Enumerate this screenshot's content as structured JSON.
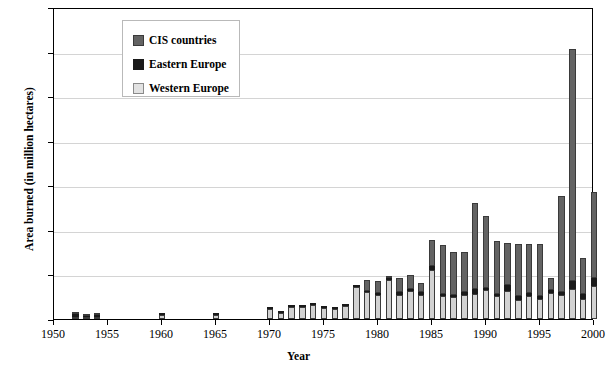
{
  "chart_data": {
    "type": "bar",
    "stacked": true,
    "title": "",
    "xlabel": "Year",
    "ylabel": "Area burned (in million hectares)",
    "xlim": [
      1950,
      2000
    ],
    "ylim": [
      0,
      7
    ],
    "y_ticks": [
      0,
      1,
      2,
      3,
      4,
      5,
      6,
      7
    ],
    "x_ticks": [
      1950,
      1955,
      1960,
      1965,
      1970,
      1975,
      1980,
      1985,
      1990,
      1995,
      2000
    ],
    "grid": "horizontal",
    "legend_position": "top-left",
    "legend": [
      "CIS countries",
      "Eastern Europe",
      "Western Europe"
    ],
    "colors": {
      "cis": "#636363",
      "eastern": "#1a1a1a",
      "western": "#d2d2d2"
    },
    "categories": [
      1950,
      1951,
      1952,
      1953,
      1954,
      1955,
      1956,
      1957,
      1958,
      1959,
      1960,
      1961,
      1962,
      1963,
      1964,
      1965,
      1966,
      1967,
      1968,
      1969,
      1970,
      1971,
      1972,
      1973,
      1974,
      1975,
      1976,
      1977,
      1978,
      1979,
      1980,
      1981,
      1982,
      1983,
      1984,
      1985,
      1986,
      1987,
      1988,
      1989,
      1990,
      1991,
      1992,
      1993,
      1994,
      1995,
      1996,
      1997,
      1998,
      1999,
      2000
    ],
    "series": [
      {
        "name": "Western Europe",
        "values": [
          0,
          0,
          0.05,
          0.04,
          0.05,
          0,
          0,
          0,
          0,
          0,
          0.08,
          0,
          0,
          0,
          0,
          0.09,
          0,
          0,
          0,
          0,
          0.22,
          0.14,
          0.26,
          0.28,
          0.31,
          0.24,
          0.23,
          0.3,
          0.72,
          0.6,
          0.53,
          0.88,
          0.55,
          0.62,
          0.55,
          1.1,
          0.52,
          0.5,
          0.55,
          0.57,
          0.65,
          0.52,
          0.62,
          0.43,
          0.52,
          0.45,
          0.59,
          0.55,
          0.68,
          0.46,
          0.73
        ]
      },
      {
        "name": "Eastern Europe",
        "values": [
          0,
          0,
          0.06,
          0.03,
          0.04,
          0,
          0,
          0,
          0,
          0,
          0.01,
          0,
          0,
          0,
          0,
          0.01,
          0,
          0,
          0,
          0,
          0.02,
          0.01,
          0.02,
          0.02,
          0.02,
          0.02,
          0.02,
          0.02,
          0.03,
          0.03,
          0.05,
          0.05,
          0.06,
          0.05,
          0.06,
          0.08,
          0.05,
          0.05,
          0.05,
          0.1,
          0.05,
          0.05,
          0.14,
          0.08,
          0.07,
          0.06,
          0.05,
          0.06,
          0.17,
          0.1,
          0.18
        ]
      },
      {
        "name": "CIS countries",
        "values": [
          0,
          0,
          0.02,
          0.02,
          0.02,
          0,
          0,
          0,
          0,
          0,
          0,
          0,
          0,
          0,
          0,
          0,
          0,
          0,
          0,
          0,
          0,
          0,
          0,
          0,
          0,
          0,
          0,
          0,
          0,
          0.25,
          0.28,
          0.02,
          0.32,
          0.32,
          0.2,
          0.6,
          1.1,
          0.95,
          0.9,
          1.93,
          1.62,
          1.18,
          0.95,
          1.18,
          1.1,
          1.18,
          0.28,
          2.15,
          5.2,
          0.8,
          1.94
        ]
      }
    ]
  },
  "axes": {
    "y_title": "Area burned (in million hectares)",
    "x_title": "Year",
    "y_tick_labels": [
      "0",
      "1",
      "2",
      "3",
      "4",
      "5",
      "6",
      "7"
    ],
    "x_tick_labels": [
      "1950",
      "1955",
      "1960",
      "1965",
      "1970",
      "1975",
      "1980",
      "1985",
      "1990",
      "1995",
      "2000"
    ]
  },
  "legend": {
    "items": [
      {
        "label": "CIS countries",
        "swatch": "cis-swatch"
      },
      {
        "label": "Eastern Europe",
        "swatch": "eastern-swatch"
      },
      {
        "label": "Western Europe",
        "swatch": "western-swatch"
      }
    ]
  }
}
